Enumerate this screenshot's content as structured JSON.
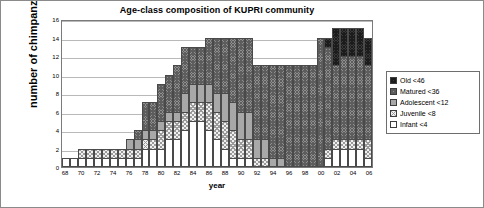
{
  "chart_data": {
    "type": "bar",
    "subtype": "stacked-vertical",
    "title": "Age-class composition of KUPRI community",
    "xlabel": "year",
    "ylabel": "number of chimpanzees",
    "ylim": [
      0,
      16
    ],
    "ytick_step": 2,
    "yticks": [
      "0",
      "2",
      "4",
      "6",
      "8",
      "10",
      "12",
      "14",
      "16"
    ],
    "grid": "horizontal",
    "legend_position": "right-outside",
    "categories": [
      "68",
      "69",
      "70",
      "71",
      "72",
      "73",
      "74",
      "75",
      "76",
      "77",
      "78",
      "79",
      "80",
      "81",
      "82",
      "83",
      "84",
      "85",
      "86",
      "87",
      "88",
      "89",
      "90",
      "91",
      "92",
      "93",
      "94",
      "95",
      "96",
      "97",
      "98",
      "99",
      "00",
      "01",
      "02",
      "03",
      "04",
      "05",
      "06"
    ],
    "xtick_labels": [
      "68",
      "70",
      "72",
      "74",
      "76",
      "78",
      "80",
      "82",
      "84",
      "86",
      "88",
      "90",
      "92",
      "94",
      "96",
      "98",
      "00",
      "02",
      "04",
      "06"
    ],
    "series": [
      {
        "name": "Infant <4",
        "key": "infant",
        "pattern": "solid-white",
        "values": [
          1,
          1,
          1,
          1,
          1,
          1,
          1,
          1,
          1,
          1,
          2,
          2,
          2,
          3,
          3,
          4,
          5,
          5,
          4,
          3,
          2,
          1,
          1,
          1,
          0,
          0,
          0,
          0,
          0,
          0,
          0,
          0,
          0,
          1,
          2,
          2,
          2,
          2,
          1
        ]
      },
      {
        "name": "Juvenile <8",
        "key": "juvenile",
        "pattern": "cross-hatch-light",
        "values": [
          0,
          0,
          1,
          1,
          1,
          1,
          1,
          1,
          1,
          1,
          1,
          1,
          2,
          2,
          2,
          2,
          2,
          2,
          3,
          3,
          3,
          3,
          2,
          2,
          1,
          1,
          0,
          0,
          0,
          0,
          0,
          0,
          0,
          1,
          1,
          1,
          1,
          1,
          2
        ]
      },
      {
        "name": "Adolescent <12",
        "key": "adolescent",
        "pattern": "solid-gray",
        "values": [
          0,
          0,
          0,
          0,
          0,
          0,
          0,
          0,
          1,
          1,
          1,
          1,
          1,
          1,
          1,
          2,
          2,
          2,
          2,
          2,
          3,
          3,
          3,
          3,
          2,
          2,
          1,
          1,
          0,
          0,
          0,
          0,
          0,
          0,
          0,
          0,
          0,
          0,
          0
        ]
      },
      {
        "name": "Matured <36",
        "key": "matured",
        "pattern": "dense-hatch-gray",
        "values": [
          0,
          0,
          0,
          0,
          0,
          0,
          0,
          0,
          0,
          1,
          3,
          3,
          4,
          4,
          5,
          5,
          4,
          4,
          5,
          6,
          6,
          7,
          8,
          8,
          8,
          8,
          10,
          10,
          11,
          11,
          11,
          11,
          14,
          11,
          8,
          9,
          9,
          9,
          8
        ]
      },
      {
        "name": "Old <46",
        "key": "old",
        "pattern": "dense-hatch-dark",
        "values": [
          0,
          0,
          0,
          0,
          0,
          0,
          0,
          0,
          0,
          0,
          0,
          0,
          0,
          0,
          0,
          0,
          0,
          0,
          0,
          0,
          0,
          0,
          0,
          0,
          0,
          0,
          0,
          0,
          0,
          0,
          0,
          0,
          0,
          1,
          4,
          3,
          3,
          3,
          3
        ]
      }
    ],
    "totals": [
      1,
      1,
      2,
      2,
      2,
      2,
      2,
      2,
      3,
      3,
      7,
      7,
      9,
      10,
      11,
      13,
      13,
      13,
      14,
      14,
      14,
      14,
      14,
      14,
      11,
      11,
      11,
      11,
      11,
      11,
      11,
      11,
      14,
      14,
      15,
      15,
      15,
      15,
      14
    ],
    "legend": [
      {
        "label": "Old <46",
        "key": "old"
      },
      {
        "label": "Matured <36",
        "key": "matured"
      },
      {
        "label": "Adolescent <12",
        "key": "adolescent"
      },
      {
        "label": "Juvenile <8",
        "key": "juvenile"
      },
      {
        "label": "Infant <4",
        "key": "infant"
      }
    ]
  }
}
